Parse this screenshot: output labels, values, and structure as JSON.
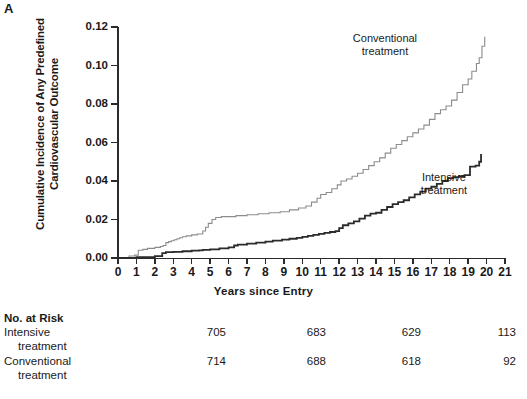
{
  "panel": {
    "label": "A"
  },
  "chart_data": {
    "type": "line",
    "subtype": "kaplan-meier-cumulative-incidence",
    "title": "",
    "xlabel": "Years since Entry",
    "ylabel_line1": "Cumulative Incidence of Any Predefined",
    "ylabel_line2": "Cardiovascular Outcome",
    "xlim": [
      0,
      21
    ],
    "ylim": [
      0.0,
      0.12
    ],
    "xticks": [
      0,
      1,
      2,
      3,
      4,
      5,
      6,
      7,
      8,
      9,
      10,
      11,
      12,
      13,
      14,
      15,
      16,
      17,
      18,
      19,
      20,
      21
    ],
    "xtick_labels": [
      "0",
      "1",
      "2",
      "3",
      "4",
      "5",
      "6",
      "7",
      "8",
      "9",
      "10",
      "11",
      "12",
      "13",
      "14",
      "15",
      "16",
      "17",
      "18",
      "19",
      "20",
      "21"
    ],
    "yticks": [
      0.0,
      0.02,
      0.04,
      0.06,
      0.08,
      0.1,
      0.12
    ],
    "ytick_labels": [
      "0.00",
      "0.02",
      "0.04",
      "0.06",
      "0.08",
      "0.10",
      "0.12"
    ],
    "grid": false,
    "legend_position": "inline-annotations",
    "annotations": [
      {
        "name": "conventional",
        "text_line1": "Conventional",
        "text_line2": "treatment",
        "x": 16.0,
        "y": 0.113
      },
      {
        "name": "intensive",
        "text_line1": "Intensive",
        "text_line2": "treatment",
        "x": 17.4,
        "y": 0.04
      }
    ],
    "series": [
      {
        "name": "Conventional treatment",
        "color": "#8c8c8c",
        "linewidth": 1.1,
        "x": [
          0,
          0.6,
          0.9,
          1.1,
          1.35,
          1.6,
          2.0,
          2.3,
          2.45,
          2.6,
          2.75,
          2.9,
          3.05,
          3.2,
          3.35,
          3.5,
          3.7,
          4.0,
          4.3,
          4.6,
          4.75,
          4.9,
          5.1,
          5.3,
          5.6,
          6.4,
          7.0,
          7.6,
          8.2,
          8.8,
          9.3,
          9.8,
          10.2,
          10.5,
          10.8,
          11.0,
          11.3,
          11.6,
          11.9,
          12.1,
          12.4,
          12.7,
          13.0,
          13.3,
          13.6,
          13.9,
          14.2,
          14.5,
          14.8,
          15.1,
          15.4,
          15.7,
          16.0,
          16.3,
          16.6,
          16.9,
          17.2,
          17.5,
          17.8,
          18.1,
          18.4,
          18.7,
          19.0,
          19.2,
          19.45,
          19.6,
          19.75,
          19.9
        ],
        "y": [
          0.0,
          0.001,
          0.0015,
          0.004,
          0.0045,
          0.005,
          0.0055,
          0.006,
          0.0065,
          0.008,
          0.0085,
          0.009,
          0.0095,
          0.01,
          0.0105,
          0.011,
          0.0115,
          0.012,
          0.0125,
          0.014,
          0.016,
          0.018,
          0.02,
          0.021,
          0.0215,
          0.022,
          0.0225,
          0.023,
          0.0235,
          0.024,
          0.025,
          0.026,
          0.027,
          0.029,
          0.031,
          0.033,
          0.034,
          0.036,
          0.038,
          0.04,
          0.041,
          0.0425,
          0.044,
          0.046,
          0.048,
          0.05,
          0.052,
          0.0545,
          0.057,
          0.059,
          0.061,
          0.063,
          0.065,
          0.067,
          0.069,
          0.072,
          0.075,
          0.077,
          0.079,
          0.082,
          0.086,
          0.09,
          0.093,
          0.097,
          0.101,
          0.104,
          0.11,
          0.115
        ]
      },
      {
        "name": "Intensive treatment",
        "color": "#2b2b2b",
        "linewidth": 1.8,
        "x": [
          0,
          1.0,
          2.0,
          2.4,
          2.6,
          3.0,
          3.5,
          4.0,
          4.4,
          4.6,
          5.0,
          5.5,
          6.0,
          6.3,
          6.5,
          7.0,
          7.5,
          8.0,
          8.4,
          8.9,
          9.3,
          9.7,
          10.0,
          10.3,
          10.6,
          10.9,
          11.2,
          11.5,
          11.8,
          12.0,
          12.2,
          12.5,
          12.8,
          13.1,
          13.4,
          13.7,
          14.0,
          14.3,
          14.6,
          14.9,
          15.2,
          15.5,
          15.8,
          16.1,
          16.4,
          16.7,
          17.0,
          17.3,
          17.6,
          17.9,
          18.2,
          18.5,
          18.8,
          19.1,
          19.4,
          19.6,
          19.7
        ],
        "y": [
          0.0,
          0.0005,
          0.001,
          0.0025,
          0.003,
          0.0032,
          0.0035,
          0.0038,
          0.004,
          0.0042,
          0.0045,
          0.005,
          0.0055,
          0.0065,
          0.007,
          0.0075,
          0.008,
          0.0085,
          0.009,
          0.0095,
          0.01,
          0.0105,
          0.011,
          0.0115,
          0.012,
          0.0125,
          0.013,
          0.0135,
          0.014,
          0.0155,
          0.017,
          0.018,
          0.019,
          0.0205,
          0.022,
          0.023,
          0.0235,
          0.025,
          0.0265,
          0.028,
          0.029,
          0.03,
          0.0315,
          0.033,
          0.0345,
          0.036,
          0.037,
          0.0385,
          0.04,
          0.0415,
          0.042,
          0.0425,
          0.043,
          0.0475,
          0.048,
          0.05,
          0.054
        ]
      }
    ]
  },
  "risk_table": {
    "title": "No. at Risk",
    "column_years": [
      5,
      10,
      15,
      20
    ],
    "rows": [
      {
        "name_line1": "Intensive",
        "name_line2": "treatment",
        "values": [
          "705",
          "683",
          "629",
          "113"
        ]
      },
      {
        "name_line1": "Conventional",
        "name_line2": "treatment",
        "values": [
          "714",
          "688",
          "618",
          "92"
        ]
      }
    ]
  }
}
